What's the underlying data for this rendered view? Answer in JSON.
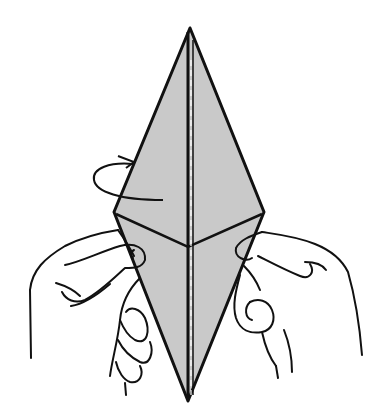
{
  "figure": {
    "title": "Origami fold step: hands holding diamond base, turn over",
    "paper_color": "#c8c8c8",
    "line_color": "#111111",
    "background": "#ffffff",
    "elements": [
      {
        "name": "diamond-paper",
        "description": "Kite/diamond shaped folded paper, grey"
      },
      {
        "name": "turn-over-arrow",
        "description": "Curved arrow on left indicating turn over"
      },
      {
        "name": "left-hand",
        "description": "Left hand pinching left side"
      },
      {
        "name": "right-hand",
        "description": "Right hand pinching right side"
      }
    ]
  }
}
